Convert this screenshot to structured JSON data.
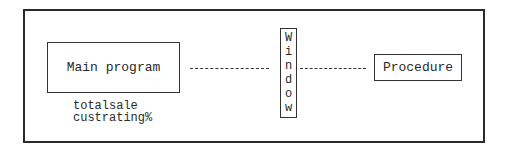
{
  "diagram": {
    "main_program": {
      "label": "Main program"
    },
    "variables": [
      "totalsale",
      "custrating%"
    ],
    "window": {
      "label": "Window",
      "letters": [
        "W",
        "i",
        "n",
        "d",
        "o",
        "w"
      ]
    },
    "procedure": {
      "label": "Procedure"
    },
    "connectors": [
      {
        "from": "Main program",
        "to": "Window",
        "style": "dashed"
      },
      {
        "from": "Window",
        "to": "Procedure",
        "style": "dashed"
      }
    ]
  }
}
